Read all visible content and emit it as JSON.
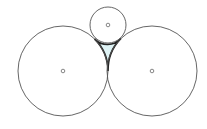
{
  "diagram": {
    "colors": {
      "stroke": "#555555",
      "region_stroke": "#222222",
      "region_fill": "#dff3f5",
      "background": "#ffffff"
    },
    "circles": [
      {
        "name": "left-circle",
        "cx": 63,
        "cy": 71,
        "r": 45
      },
      {
        "name": "right-circle",
        "cx": 152,
        "cy": 71,
        "r": 45
      },
      {
        "name": "top-circle",
        "cx": 108,
        "cy": 25,
        "r": 18
      }
    ],
    "tangent_points": [
      {
        "between": "left-right",
        "x": 108,
        "y": 71
      },
      {
        "between": "left-top",
        "x": 94.4,
        "y": 38.9
      },
      {
        "between": "right-top",
        "x": 121.6,
        "y": 38.9
      }
    ],
    "center_marker_radius": 1.8
  }
}
